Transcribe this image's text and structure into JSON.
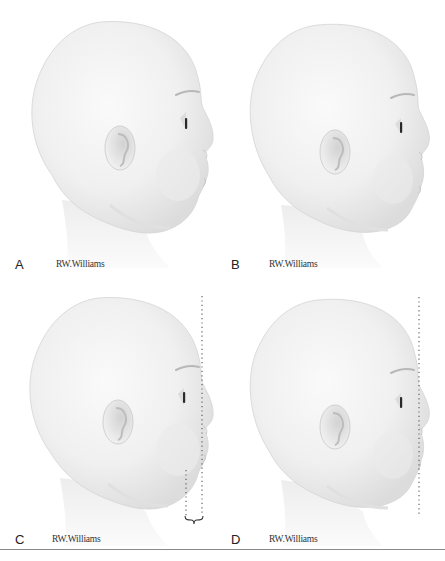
{
  "figure": {
    "panels": [
      {
        "id": "A",
        "letter": "A",
        "signature": "RW.Williams",
        "guides": []
      },
      {
        "id": "B",
        "letter": "B",
        "signature": "RW.Williams",
        "guides": []
      },
      {
        "id": "C",
        "letter": "C",
        "signature": "RW.Williams",
        "guides": [
          "vertical-dotted-line-forehead-to-chin",
          "vertical-dotted-line-chin",
          "curly-brace"
        ]
      },
      {
        "id": "D",
        "letter": "D",
        "signature": "RW.Williams",
        "guides": [
          "vertical-dotted-line-forehead-to-chin"
        ]
      }
    ],
    "colors": {
      "background": "#ffffff",
      "skin_light": "#f4f4f4",
      "skin_shade": "#d9d9d9",
      "outline": "#c8c8c8",
      "eye": "#2a2a2a",
      "guide_line": "#555555",
      "rule": "#8a8a8a"
    }
  }
}
